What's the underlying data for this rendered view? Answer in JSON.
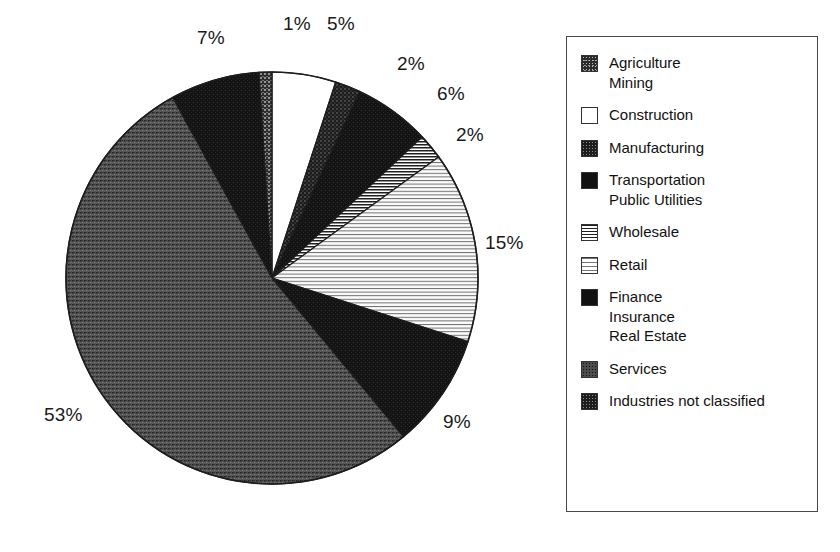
{
  "chart_data": {
    "type": "pie",
    "title": "",
    "subtitle": "",
    "xlabel": "",
    "ylabel": "",
    "legend_position": "right",
    "grid": false,
    "start_angle_deg": 0,
    "direction": "clockwise",
    "categories": [
      "Agriculture Mining",
      "Construction",
      "Manufacturing",
      "Transportation Public Utilities",
      "Wholesale",
      "Retail",
      "Finance Insurance Real Estate",
      "Services",
      "Industries not classified"
    ],
    "values": [
      1,
      5,
      2,
      6,
      2,
      15,
      9,
      53,
      7
    ],
    "value_labels": [
      "1%",
      "5%",
      "2%",
      "6%",
      "2%",
      "15%",
      "9%",
      "53%",
      "7%"
    ],
    "units": "percent",
    "slices": [
      {
        "label": "Construction",
        "value": 5,
        "display": "5%",
        "pattern": "white",
        "start_deg": 0,
        "sweep_deg": 18
      },
      {
        "label": "Manufacturing",
        "value": 2,
        "display": "2%",
        "pattern": "speckle-dark",
        "start_deg": 18,
        "sweep_deg": 7.2
      },
      {
        "label": "Transportation Public Utilities",
        "value": 6,
        "display": "6%",
        "pattern": "solid-black",
        "start_deg": 25.2,
        "sweep_deg": 21.6
      },
      {
        "label": "Wholesale",
        "value": 2,
        "display": "2%",
        "pattern": "hline-dense",
        "start_deg": 46.8,
        "sweep_deg": 7.2
      },
      {
        "label": "Retail",
        "value": 15,
        "display": "15%",
        "pattern": "hline-light",
        "start_deg": 54,
        "sweep_deg": 54
      },
      {
        "label": "Finance Insurance Real Estate",
        "value": 9,
        "display": "9%",
        "pattern": "solid-black",
        "start_deg": 108,
        "sweep_deg": 32.4
      },
      {
        "label": "Services",
        "value": 53,
        "display": "53%",
        "pattern": "gray-stipple",
        "start_deg": 140.4,
        "sweep_deg": 190.8
      },
      {
        "label": "Industries not classified",
        "value": 7,
        "display": "7%",
        "pattern": "solid-black",
        "start_deg": 331.2,
        "sweep_deg": 25.2
      },
      {
        "label": "Agriculture Mining",
        "value": 1,
        "display": "1%",
        "pattern": "speckle-mid",
        "start_deg": 356.4,
        "sweep_deg": 3.6
      }
    ]
  },
  "labels": {
    "pct_1": "1%",
    "pct_5": "5%",
    "pct_2a": "2%",
    "pct_6": "6%",
    "pct_2b": "2%",
    "pct_15": "15%",
    "pct_9": "9%",
    "pct_53": "53%",
    "pct_7": "7%"
  },
  "legend": {
    "items": [
      {
        "swatch": "speckle-mid",
        "lines": [
          "Agriculture",
          "Mining"
        ]
      },
      {
        "swatch": "white",
        "lines": [
          "Construction"
        ]
      },
      {
        "swatch": "speckle-dark",
        "lines": [
          "Manufacturing"
        ]
      },
      {
        "swatch": "solid-black",
        "lines": [
          "Transportation",
          "Public Utilities"
        ]
      },
      {
        "swatch": "hline-dense",
        "lines": [
          "Wholesale"
        ]
      },
      {
        "swatch": "hline-light",
        "lines": [
          "Retail"
        ]
      },
      {
        "swatch": "solid-black",
        "lines": [
          "Finance",
          "Insurance",
          "Real Estate"
        ]
      },
      {
        "swatch": "gray-stipple",
        "lines": [
          "Services"
        ]
      },
      {
        "swatch": "speckle-dark",
        "lines": [
          "Industries not classified"
        ]
      }
    ]
  },
  "colors": {
    "ink": "#111111",
    "paper": "#ffffff",
    "border": "#4a4a4a",
    "black_fill": "#141414",
    "gray_fill": "#4d4d4d",
    "light_fill": "#d9d9d9"
  }
}
